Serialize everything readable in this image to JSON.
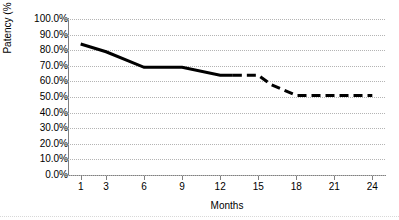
{
  "chart_data": {
    "type": "line",
    "title": "",
    "xlabel": "Months",
    "ylabel": "Patency (%",
    "xlim": [
      0,
      25
    ],
    "ylim": [
      0,
      1.0
    ],
    "grid": "horizontal-dotted",
    "legend": "none",
    "x_ticks": [
      1,
      3,
      6,
      9,
      12,
      15,
      18,
      21,
      24
    ],
    "x_tick_labels": [
      "1",
      "3",
      "6",
      "9",
      "12",
      "15",
      "18",
      "21",
      "24"
    ],
    "y_ticks": [
      0,
      10,
      20,
      30,
      40,
      50,
      60,
      70,
      80,
      90,
      100
    ],
    "y_tick_labels": [
      "100.0%",
      "90.0%",
      "80.0%",
      "70.0%",
      "60.0%",
      "50.0%",
      "40.0%",
      "30.0%",
      "20.0%",
      "10.0%",
      "0.0%"
    ],
    "series": [
      {
        "name": "Patency",
        "color": "#000000",
        "line_width": 3,
        "x": [
          1,
          3,
          6,
          9,
          12,
          13,
          15,
          16,
          18,
          24
        ],
        "values": [
          84,
          79,
          69,
          69,
          64,
          64,
          64,
          58,
          51,
          51
        ],
        "solid_until_x": 13,
        "dashed_from_x": 13
      }
    ],
    "annotations": []
  },
  "axes": {
    "y_title": "Patency (%",
    "x_title": "Months"
  },
  "colors": {
    "series": "#000000",
    "gridline": "#b4b4b4",
    "axis": "#808080",
    "background": "#ffffff",
    "text": "#000000"
  }
}
